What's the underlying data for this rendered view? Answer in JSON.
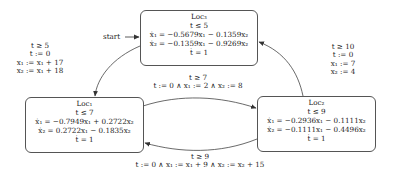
{
  "diagram": {
    "type": "hybrid-automaton",
    "start_label": "start",
    "locations": [
      {
        "id": "loc3",
        "name": "Loc₃",
        "invariant": "t ≤ 5",
        "flow": [
          "ẋ₁ = −0.5679x₁ − 0.1359x₂",
          "ẋ₂ = −0.1359x₁ − 0.9269x₂",
          "ṫ = 1"
        ],
        "initial": true
      },
      {
        "id": "loc1",
        "name": "Loc₁",
        "invariant": "t ≤ 7",
        "flow": [
          "ẋ₁ = −0.7949x₁ + 0.2722x₂",
          "ẋ₂ = 0.2722x₁ − 0.1835x₂",
          "ṫ = 1"
        ]
      },
      {
        "id": "loc2",
        "name": "Loc₂",
        "invariant": "t ≤ 9",
        "flow": [
          "ẋ₁ = −0.2936x₁ − 0.1111x₂",
          "ẋ₂ = −0.1111x₁ − 0.4496x₂",
          "ṫ = 1"
        ]
      }
    ],
    "transitions": [
      {
        "from": "loc3",
        "to": "loc1",
        "lines": [
          "t ≥ 5",
          "t := 0",
          "x₁ := x₁ + 17",
          "x₂ := x₁ + 18"
        ]
      },
      {
        "from": "loc1",
        "to": "loc2",
        "lines": [
          "t ≥ 7",
          "t := 0 ∧ x₁ := 2 ∧ x₂ := 8"
        ]
      },
      {
        "from": "loc2",
        "to": "loc1",
        "lines": [
          "t ≥ 9",
          "t := 0 ∧ x₁ := x₁ + 9 ∧ x₂ := x₂ + 15"
        ]
      },
      {
        "from": "loc2",
        "to": "loc3",
        "lines": [
          "t ≥ 10",
          "t := 0",
          "x₁ := 7",
          "x₂ := 4"
        ]
      }
    ]
  }
}
